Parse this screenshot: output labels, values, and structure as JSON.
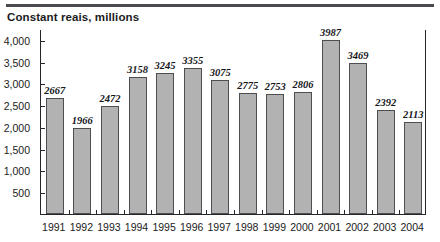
{
  "figure": {
    "title": "Constant reais, millions",
    "bar_fill_color": "#b2b2b2",
    "bar_border_color": "#4d4d52",
    "axis_color": "#26262a",
    "text_color": "#1b1b1b"
  },
  "chart_data": {
    "type": "bar",
    "title": "Constant reais, millions",
    "xlabel": "",
    "ylabel": "",
    "categories": [
      "1991",
      "1992",
      "1993",
      "1994",
      "1995",
      "1996",
      "1997",
      "1998",
      "1999",
      "2000",
      "2001",
      "2002",
      "2003",
      "2004"
    ],
    "values": [
      2667,
      1966,
      2472,
      3158,
      3245,
      3355,
      3075,
      2775,
      2753,
      2806,
      3987,
      3469,
      2392,
      2113
    ],
    "value_labels": [
      "2667",
      "1966",
      "2472",
      "3158",
      "3245",
      "3355",
      "3075",
      "2775",
      "2753",
      "2806",
      "3987",
      "3469",
      "2392",
      "2113"
    ],
    "ylim": [
      0,
      4250
    ],
    "yticks": [
      500,
      1000,
      1500,
      2000,
      2500,
      3000,
      3500,
      4000
    ],
    "ytick_labels": [
      "500",
      "1,000",
      "1,500",
      "2,000",
      "2,500",
      "3,000",
      "3,500",
      "4,000"
    ],
    "grid": false,
    "legend": null
  }
}
